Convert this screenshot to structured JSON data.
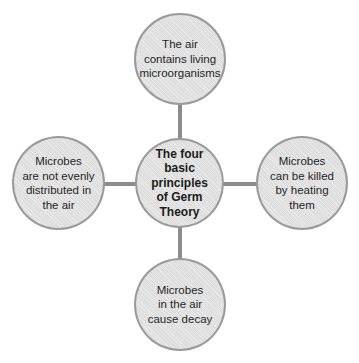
{
  "diagram": {
    "type": "hub-and-spoke mind map",
    "center": {
      "label": "The four basic principles of Germ Theory",
      "lines": [
        "The four",
        "basic",
        "principles",
        "of Germ",
        "Theory"
      ]
    },
    "nodes": {
      "top": {
        "label": "The air contains living microorganisms",
        "lines": [
          "The air",
          "contains living",
          "microorganisms"
        ]
      },
      "left": {
        "label": "Microbes are not evenly distributed in the air",
        "lines": [
          "Microbes",
          "are not evenly",
          "distributed in",
          "the air"
        ]
      },
      "right": {
        "label": "Microbes can be killed by heating them",
        "lines": [
          "Microbes",
          "can be killed",
          "by heating",
          "them"
        ]
      },
      "bottom": {
        "label": "Microbes in the air cause decay",
        "lines": [
          "Microbes",
          "in the air",
          "cause decay"
        ]
      }
    },
    "colors": {
      "node_fill": "#e2e2e2",
      "node_border": "#9a9a9a",
      "connector": "#8c8c8c",
      "text": "#262626"
    }
  }
}
